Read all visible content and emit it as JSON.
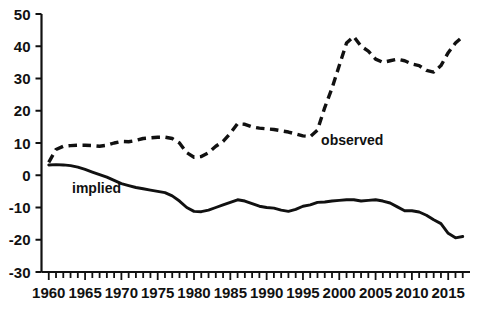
{
  "chart_data": {
    "type": "line",
    "title": "",
    "xlabel": "",
    "ylabel": "",
    "xlim": [
      1959,
      2018
    ],
    "ylim": [
      -30,
      50
    ],
    "grid": false,
    "legend_position": "inline-annotations",
    "y_ticks": [
      -30,
      -20,
      -10,
      0,
      10,
      20,
      30,
      40,
      50
    ],
    "y_tick_labels": [
      "-30",
      "-20",
      "-10",
      "0",
      "10",
      "20",
      "30",
      "40",
      "50"
    ],
    "x_ticks": [
      1960,
      1965,
      1970,
      1975,
      1980,
      1985,
      1990,
      1995,
      2000,
      2005,
      2010,
      2015
    ],
    "x_tick_labels": [
      "1960",
      "1965",
      "1970",
      "1975",
      "1980",
      "1985",
      "1990",
      "1995",
      "2000",
      "2005",
      "2010",
      "2015"
    ],
    "x_minor_tick_step": 1,
    "x": [
      1960,
      1961,
      1962,
      1963,
      1964,
      1965,
      1966,
      1967,
      1968,
      1969,
      1970,
      1971,
      1972,
      1973,
      1974,
      1975,
      1976,
      1977,
      1978,
      1979,
      1980,
      1981,
      1982,
      1983,
      1984,
      1985,
      1986,
      1987,
      1988,
      1989,
      1990,
      1991,
      1992,
      1993,
      1994,
      1995,
      1996,
      1997,
      1998,
      1999,
      2000,
      2001,
      2002,
      2003,
      2004,
      2005,
      2006,
      2007,
      2008,
      2009,
      2010,
      2011,
      2012,
      2013,
      2014,
      2015,
      2016,
      2017
    ],
    "series": [
      {
        "name": "observed",
        "style": "dashed",
        "color": "#111111",
        "label_x": 1997.5,
        "label_y": 9.5,
        "values": [
          4.0,
          8.0,
          9.0,
          9.2,
          9.3,
          9.3,
          9.2,
          9.0,
          9.3,
          10.0,
          10.5,
          10.4,
          10.8,
          11.4,
          11.6,
          11.8,
          11.8,
          11.4,
          10.0,
          7.0,
          5.6,
          5.8,
          7.0,
          9.0,
          10.5,
          13.0,
          16.0,
          15.8,
          15.0,
          14.6,
          14.4,
          14.2,
          13.8,
          13.4,
          12.8,
          12.2,
          12.0,
          14.0,
          21.0,
          27.0,
          34.0,
          41.0,
          43.0,
          40.0,
          38.5,
          36.0,
          35.0,
          35.5,
          36.0,
          35.5,
          34.5,
          34.0,
          32.5,
          32.0,
          34.0,
          38.0,
          41.0,
          43.0
        ]
      },
      {
        "name": "implied",
        "style": "solid",
        "color": "#111111",
        "label_x": 1963.2,
        "label_y": -5.6,
        "values": [
          3.2,
          3.3,
          3.2,
          3.0,
          2.5,
          1.8,
          1.0,
          0.2,
          -0.6,
          -1.6,
          -2.6,
          -3.2,
          -3.8,
          -4.2,
          -4.6,
          -5.0,
          -5.4,
          -6.4,
          -8.0,
          -10.0,
          -11.2,
          -11.3,
          -10.8,
          -10.0,
          -9.2,
          -8.4,
          -7.6,
          -8.0,
          -8.8,
          -9.6,
          -10.0,
          -10.2,
          -10.8,
          -11.2,
          -10.6,
          -9.6,
          -9.2,
          -8.4,
          -8.3,
          -8.0,
          -7.8,
          -7.6,
          -7.6,
          -8.0,
          -7.8,
          -7.6,
          -8.0,
          -8.6,
          -9.8,
          -11.0,
          -11.0,
          -11.4,
          -12.4,
          -13.8,
          -15.0,
          -18.0,
          -19.4,
          -19.0
        ]
      }
    ]
  }
}
